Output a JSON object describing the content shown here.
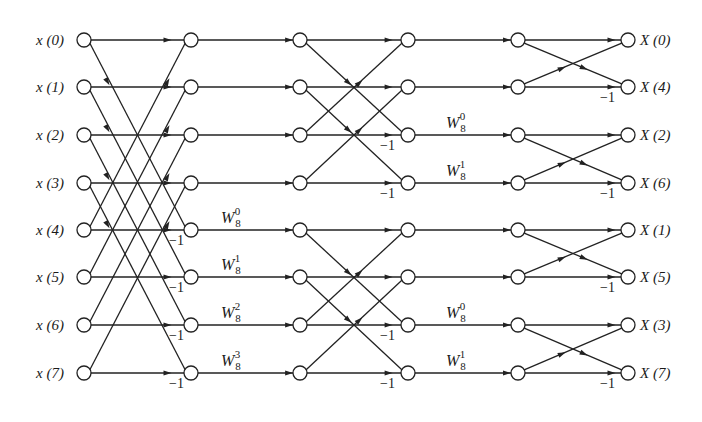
{
  "diagram": {
    "colors": {
      "stroke": "#222222",
      "background": "#ffffff",
      "text": "#1a1a1a"
    },
    "layout": {
      "columns_x": [
        84,
        191,
        300,
        408,
        518,
        628
      ],
      "rows_y": [
        40,
        87,
        135,
        183,
        230,
        277,
        325,
        373
      ],
      "node_radius": 7
    },
    "inputs": [
      {
        "name": "x",
        "index": "0"
      },
      {
        "name": "x",
        "index": "1"
      },
      {
        "name": "x",
        "index": "2"
      },
      {
        "name": "x",
        "index": "3"
      },
      {
        "name": "x",
        "index": "4"
      },
      {
        "name": "x",
        "index": "5"
      },
      {
        "name": "x",
        "index": "6"
      },
      {
        "name": "x",
        "index": "7"
      }
    ],
    "outputs": [
      {
        "name": "X",
        "index": "0"
      },
      {
        "name": "X",
        "index": "4"
      },
      {
        "name": "X",
        "index": "2"
      },
      {
        "name": "X",
        "index": "6"
      },
      {
        "name": "X",
        "index": "1"
      },
      {
        "name": "X",
        "index": "5"
      },
      {
        "name": "X",
        "index": "3"
      },
      {
        "name": "X",
        "index": "7"
      }
    ],
    "stage1_twiddles": [
      {
        "row": 4,
        "base": "W",
        "sub": "8",
        "sup": "0"
      },
      {
        "row": 5,
        "base": "W",
        "sub": "8",
        "sup": "1"
      },
      {
        "row": 6,
        "base": "W",
        "sub": "8",
        "sup": "2"
      },
      {
        "row": 7,
        "base": "W",
        "sub": "8",
        "sup": "3"
      }
    ],
    "stage2_twiddles": [
      {
        "row": 2,
        "base": "W",
        "sub": "8",
        "sup": "0"
      },
      {
        "row": 3,
        "base": "W",
        "sub": "8",
        "sup": "1"
      },
      {
        "row": 6,
        "base": "W",
        "sub": "8",
        "sup": "0"
      },
      {
        "row": 7,
        "base": "W",
        "sub": "8",
        "sup": "1"
      }
    ],
    "negation_label": "−1",
    "stage1_negations": [
      4,
      5,
      6,
      7
    ],
    "stage2_negations": [
      2,
      3,
      6,
      7
    ],
    "stage3_negations": [
      1,
      3,
      5,
      7
    ],
    "butterflies": {
      "stage1_span": 4,
      "stage2_span": 2,
      "stage3_span": 1
    }
  }
}
